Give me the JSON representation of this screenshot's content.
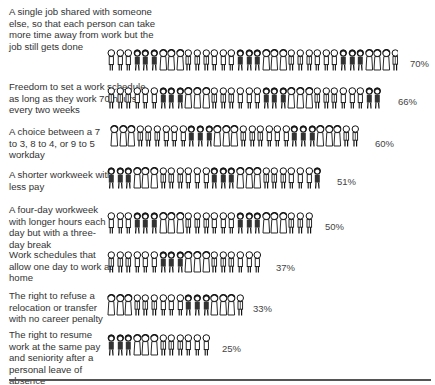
{
  "chart_data": {
    "type": "bar",
    "subtype": "pictograph",
    "title": "",
    "xlabel": "",
    "ylabel": "",
    "xlim": [
      0,
      100
    ],
    "grid": false,
    "legend": null,
    "categories": [
      "A single job shared with someone else, so that each person can take more time away from work but the job still gets done",
      "Freedom to set a work schedule, as long as they work 70 hours every two weeks",
      "A choice between a 7 to 3, 8 to 4, or 9 to 5 workday",
      "A shorter workweek with less pay",
      "A four-day workweek with longer hours each day but with a three-day break",
      "Work schedules that allow one day to work at home",
      "The right to refuse a relocation or transfer with no career penalty",
      "The right to resume work at the same pay and seniority after a personal leave of absence"
    ],
    "values": [
      70,
      66,
      60,
      51,
      50,
      37,
      33,
      25
    ],
    "value_labels": [
      "70%",
      "66%",
      "60%",
      "51%",
      "50%",
      "37%",
      "33%",
      "25%"
    ],
    "units": "%"
  },
  "rows": [
    {
      "label": "A single job shared with someone else, so that each person can take more time away from work but the job still gets done",
      "pct": "70%"
    },
    {
      "label": "Freedom to set a work schedule, as long as they work 70 hours every two weeks",
      "pct": "66%"
    },
    {
      "label": "A choice between a 7 to 3, 8 to 4, or 9 to 5 workday",
      "pct": "60%"
    },
    {
      "label": "A shorter workweek with less pay",
      "pct": "51%"
    },
    {
      "label": "A four-day workweek with longer hours each day but with a three-day break",
      "pct": "50%"
    },
    {
      "label": "Work schedules that allow one day to work at home",
      "pct": "37%"
    },
    {
      "label": "The right to refuse a relocation or transfer with no career penalty",
      "pct": "33%"
    },
    {
      "label": "The right to resume work at the same pay and seniority after a personal leave of absence",
      "pct": "25%"
    }
  ],
  "icon": "person-figure-icon"
}
